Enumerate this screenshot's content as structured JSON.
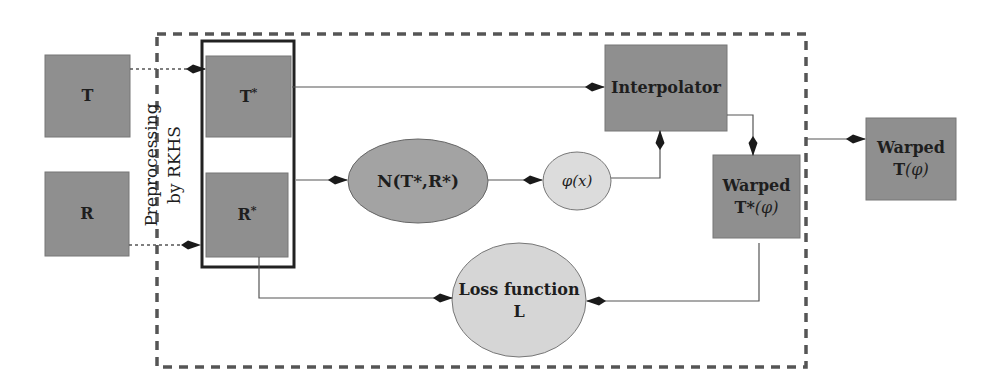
{
  "diagram": {
    "type": "flowchart",
    "colors": {
      "box_fill": "#8f8f8f",
      "ellipse_dark_fill": "#a3a3a3",
      "ellipse_light_fill": "#d9d9d9",
      "line": "#444444",
      "arrow": "#1a1a1a",
      "dashed_border": "#555555",
      "inner_border": "#222222"
    },
    "nodes": {
      "T": {
        "label": "T"
      },
      "R": {
        "label": "R"
      },
      "T_star": {
        "label": "T",
        "sup": "*"
      },
      "R_star": {
        "label": "R",
        "sup": "*"
      },
      "preprocessing": {
        "line1": "Preprocessing",
        "line2": "by RKHS"
      },
      "network": {
        "label": "N(T*,R*)"
      },
      "phi": {
        "label": "φ(x)"
      },
      "interpolator": {
        "label": "Interpolator"
      },
      "warped_t_star": {
        "line1": "Warped",
        "line2_bold": "T*",
        "line2_rest": "(φ)"
      },
      "warped_t": {
        "line1": "Warped",
        "line2_bold": "T",
        "line2_rest": "(φ)"
      },
      "loss": {
        "line1": "Loss function",
        "line2": "L"
      }
    },
    "edges": [
      {
        "from": "T",
        "to": "T_star",
        "style": "dotted"
      },
      {
        "from": "R",
        "to": "R_star",
        "style": "dotted"
      },
      {
        "from": "T_star",
        "to": "interpolator",
        "style": "solid"
      },
      {
        "from": "preprocessed_pair",
        "to": "network",
        "style": "solid"
      },
      {
        "from": "network",
        "to": "phi",
        "style": "solid"
      },
      {
        "from": "phi",
        "to": "interpolator",
        "style": "solid"
      },
      {
        "from": "interpolator",
        "to": "warped_t_star",
        "style": "solid"
      },
      {
        "from": "dashed_box",
        "to": "warped_t",
        "style": "solid"
      },
      {
        "from": "R_star",
        "to": "loss",
        "style": "solid"
      },
      {
        "from": "warped_t_star",
        "to": "loss",
        "style": "solid"
      }
    ]
  }
}
